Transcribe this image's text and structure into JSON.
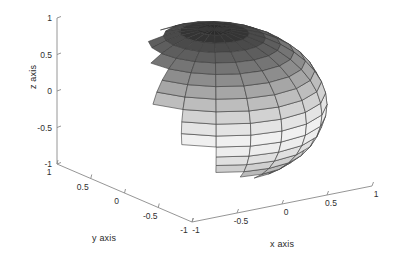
{
  "figure": {
    "background_color": "#ffffff",
    "axis_line_color": "#8a8a8a",
    "mesh_line_color": "#3a3a3a",
    "tick_text_color": "#2f2f2f"
  },
  "axes": {
    "x": {
      "title": "x axis",
      "ticks": [
        "-1",
        "-0.5",
        "0",
        "0.5",
        "1"
      ],
      "tick_values": [
        -1,
        -0.5,
        0,
        0.5,
        1
      ],
      "range": [
        -1,
        1
      ]
    },
    "y": {
      "title": "y axis",
      "ticks": [
        "1",
        "0.5",
        "0",
        "-0.5",
        "-1"
      ],
      "tick_values": [
        1,
        0.5,
        0,
        -0.5,
        -1
      ],
      "range": [
        -1,
        1
      ]
    },
    "z": {
      "title": "z axis",
      "ticks": [
        "1",
        "0.5",
        "0",
        "-0.5",
        "-1"
      ],
      "tick_values": [
        1,
        0.5,
        0,
        -0.5,
        -1
      ],
      "range": [
        -1,
        1
      ]
    }
  },
  "chart_data": {
    "type": "surface",
    "title": "",
    "xlabel": "x axis",
    "ylabel": "y axis",
    "zlabel": "z axis",
    "xlim": [
      -1,
      1
    ],
    "ylim": [
      -1,
      1
    ],
    "zlim": [
      -1,
      1
    ],
    "grid": false,
    "legend": "none",
    "surface": {
      "shape": "sphere",
      "radius": 1,
      "center": [
        0,
        0,
        0
      ],
      "n_parallels": 20,
      "n_meridians": 20,
      "colormap": "gray",
      "shading": "faceted",
      "edge_color": "#3a3a3a",
      "color_variable": "z",
      "band_colors": [
        "#2b2b2b",
        "#343434",
        "#4a4a4a",
        "#5e5e5e",
        "#757575",
        "#8d8d8d",
        "#a6a6a6",
        "#bdbdbd",
        "#d2d2d2",
        "#e4e4e4",
        "#f0f0f0",
        "#ededed",
        "#e0e0e0",
        "#cfcfcf",
        "#bababa",
        "#a2a2a2",
        "#8a8a8a",
        "#6f6f6f",
        "#4e4e4e",
        "#2e2e2e"
      ]
    },
    "view": {
      "azimuth_deg": -37.5,
      "elevation_deg": 30
    }
  },
  "projection": {
    "origin_px": [
      192,
      222
    ],
    "x_axis_end_px": [
      372,
      186
    ],
    "y_axis_end_px": [
      57,
      164
    ],
    "z_axis_top_px": [
      57,
      18
    ],
    "sphere_center_px": [
      210,
      95
    ],
    "sphere_radius_x_px": 108,
    "sphere_radius_y_px": 80
  }
}
